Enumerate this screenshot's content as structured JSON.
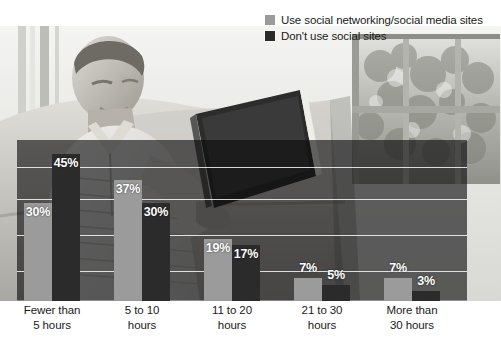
{
  "legend": {
    "items": [
      {
        "label": "Use social networking/social media sites",
        "color": "#9b9b9b",
        "icon": "legend-swatch-icon"
      },
      {
        "label": "Don't use social sites",
        "color": "#2b2b2b",
        "icon": "legend-swatch-icon"
      }
    ]
  },
  "photo": {
    "description": "man-reading-book-on-couch-photo"
  },
  "chart_data": {
    "type": "bar",
    "title": "",
    "xlabel": "",
    "ylabel": "",
    "ylim": [
      0,
      50
    ],
    "grid": true,
    "legend_position": "top-right",
    "categories": [
      "Fewer than 5 hours",
      "5 to 10 hours",
      "11 to 20 hours",
      "21 to 30 hours",
      "More than 30 hours"
    ],
    "category_lines": [
      [
        "Fewer than",
        "5 hours"
      ],
      [
        "5 to 10",
        "hours"
      ],
      [
        "11 to 20",
        "hours"
      ],
      [
        "21 to 30",
        "hours"
      ],
      [
        "More than",
        "30 hours"
      ]
    ],
    "series": [
      {
        "name": "Use social networking/social media sites",
        "color": "#9b9b9b",
        "values": [
          30,
          37,
          19,
          7,
          7
        ],
        "labels": [
          "30%",
          "37%",
          "19%",
          "7%",
          "7%"
        ]
      },
      {
        "name": "Don't use social sites",
        "color": "#2b2b2b",
        "values": [
          45,
          30,
          17,
          5,
          3
        ],
        "labels": [
          "45%",
          "30%",
          "17%",
          "5%",
          "3%"
        ]
      }
    ]
  }
}
